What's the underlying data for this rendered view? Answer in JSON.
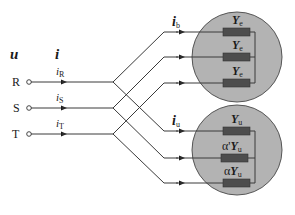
{
  "diagram": {
    "type": "three-phase circuit schematic",
    "vectors": {
      "voltage_label": "u",
      "current_label": "i"
    },
    "phases": [
      {
        "terminal": "R",
        "current": "i",
        "current_sub": "R"
      },
      {
        "terminal": "S",
        "current": "i",
        "current_sub": "S"
      },
      {
        "terminal": "T",
        "current": "i",
        "current_sub": "T"
      }
    ],
    "balanced_load": {
      "current_label": "i",
      "current_sub": "b",
      "admittances": [
        {
          "prefix": "",
          "symbol": "Y",
          "sub": "e"
        },
        {
          "prefix": "",
          "symbol": "Y",
          "sub": "e"
        },
        {
          "prefix": "",
          "symbol": "Y",
          "sub": "e"
        }
      ]
    },
    "unbalanced_load": {
      "current_label": "i",
      "current_sub": "u",
      "admittances": [
        {
          "prefix": "",
          "symbol": "Y",
          "sub": "u"
        },
        {
          "prefix": "α'",
          "symbol": "Y",
          "sub": "u"
        },
        {
          "prefix": "α",
          "symbol": "Y",
          "sub": "u"
        }
      ]
    },
    "colors": {
      "circle_fill": "#b3b3b3",
      "circle_stroke": "#555555",
      "resistor_fill": "#4d4d4d",
      "wire": "#3a3a3a"
    }
  }
}
